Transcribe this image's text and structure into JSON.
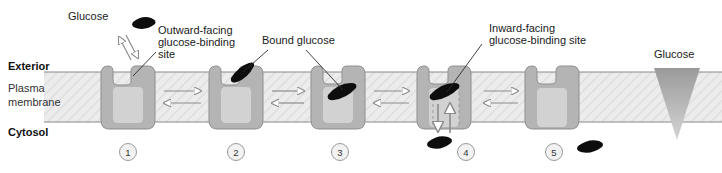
{
  "diagram": {
    "region_labels": {
      "exterior": "Exterior",
      "membrane_line1": "Plasma",
      "membrane_line2": "membrane",
      "cytosol": "Cytosol"
    },
    "callouts": [
      {
        "id": "glucose-top",
        "text": "Glucose",
        "x": 68,
        "y": 17
      },
      {
        "id": "outward-site",
        "text_lines": [
          "Outward-facing",
          "glucose-binding",
          "site"
        ],
        "x": 158,
        "y": 35
      },
      {
        "id": "bound-glucose",
        "text": "Bound glucose",
        "x": 262,
        "y": 42
      },
      {
        "id": "inward-site",
        "text_lines": [
          "Inward-facing",
          "glucose-binding site"
        ],
        "x": 487,
        "y": 32
      },
      {
        "id": "glucose-right",
        "text": "Glucose",
        "x": 655,
        "y": 60
      }
    ],
    "steps": [
      {
        "number": "1",
        "label": "1",
        "cx": 128,
        "cy": 152,
        "state": "outward-open-empty"
      },
      {
        "number": "2",
        "label": "2",
        "cx": 236,
        "cy": 152,
        "state": "outward-open-bound"
      },
      {
        "number": "3",
        "label": "3",
        "cx": 340,
        "cy": 152,
        "state": "occluded-bound"
      },
      {
        "number": "4",
        "label": "4",
        "cx": 466,
        "cy": 152,
        "state": "inward-open-bound"
      },
      {
        "number": "5",
        "label": "5",
        "cx": 554,
        "cy": 152,
        "state": "inward-open-empty"
      }
    ],
    "colors": {
      "membrane_fill": "#e9e9e9",
      "membrane_edge": "#8a8a8a",
      "protein_fill": "#b4b4b4",
      "protein_edge": "#8f8f8f",
      "pore_fill": "#d2d2d2",
      "glucose_fill": "#0d0d0d",
      "arrow_stroke": "#8c8c8c",
      "gradient_top": "#9a9a9a",
      "gradient_bottom": "#cfcfcf",
      "text": "#1a1a1a"
    },
    "membrane_geometry": {
      "top_y": 72,
      "bottom_y": 122,
      "left_x": 44,
      "right_x": 722
    },
    "gradient_wedge": {
      "label": "Glucose",
      "top_width": 46,
      "top_y": 68,
      "apex_y": 140,
      "cx": 677
    }
  }
}
